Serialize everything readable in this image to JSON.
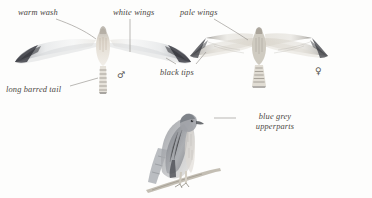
{
  "plate": {
    "title": "Hen Harrier flight and perched plate",
    "background_color": "#fdfdfc",
    "ink_color": "#4a4742",
    "leader_color": "#8d8a84",
    "width": 372,
    "height": 198
  },
  "annotations": [
    {
      "id": "warm-wash",
      "text": "warm wash",
      "x": 18,
      "y": 8,
      "align": "left"
    },
    {
      "id": "white-wings",
      "text": "white wings",
      "x": 113,
      "y": 8,
      "align": "left"
    },
    {
      "id": "pale-wings",
      "text": "pale wings",
      "x": 180,
      "y": 8,
      "align": "left"
    },
    {
      "id": "black-tips",
      "text": "black tips",
      "x": 160,
      "y": 68,
      "align": "left"
    },
    {
      "id": "long-barred-tail",
      "text": "long barred tail",
      "x": 6,
      "y": 85,
      "align": "left"
    },
    {
      "id": "blue-grey-upperparts",
      "text": "blue grey\nupperparts",
      "x": 238,
      "y": 112,
      "align": "center"
    }
  ],
  "annotation_lines": {
    "blue_grey_line1": "blue grey",
    "blue_grey_line2": "upperparts"
  },
  "sex_symbols": [
    {
      "id": "male-symbol",
      "glyph": "♂",
      "label": "male",
      "x": 117,
      "y": 70
    },
    {
      "id": "female-symbol",
      "glyph": "♀",
      "label": "female",
      "x": 315,
      "y": 66
    }
  ],
  "figures": [
    {
      "id": "male-flight",
      "name": "male harrier in flight from below",
      "pose": "flight-underside",
      "sex": "male",
      "plumage": "pale grey-white underwing, warm buff wash on breast, black wingtips, long barred tail"
    },
    {
      "id": "female-flight",
      "name": "female harrier in flight from below",
      "pose": "flight-underside",
      "sex": "female",
      "plumage": "pale brown underwing with barring, dark tips, barred tail"
    },
    {
      "id": "perched-bird",
      "name": "harrier perched on branch",
      "pose": "perched",
      "sex": "unspecified",
      "plumage": "blue grey upperparts, pale underparts, dark wingtips"
    }
  ]
}
